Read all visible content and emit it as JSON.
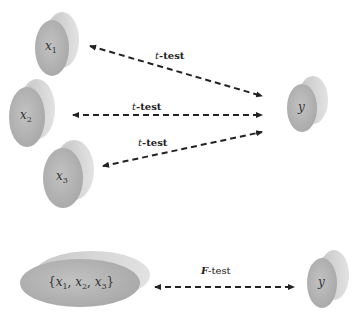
{
  "diagram": {
    "top_section": {
      "predictors": [
        {
          "id": "x1",
          "label": "x",
          "subscript": "1"
        },
        {
          "id": "x2",
          "label": "x",
          "subscript": "2"
        },
        {
          "id": "x3",
          "label": "x",
          "subscript": "3"
        }
      ],
      "response": {
        "id": "y",
        "label": "y"
      },
      "tests": [
        {
          "from": "x1",
          "to": "y",
          "label_italic": "t",
          "label_rest": "-test"
        },
        {
          "from": "x2",
          "to": "y",
          "label_italic": "t",
          "label_rest": "-test"
        },
        {
          "from": "x3",
          "to": "y",
          "label_italic": "t",
          "label_rest": "-test"
        }
      ]
    },
    "bottom_section": {
      "predictor_set": {
        "open": "{",
        "items": [
          {
            "label": "x",
            "subscript": "1"
          },
          {
            "label": "x",
            "subscript": "2"
          },
          {
            "label": "x",
            "subscript": "3"
          }
        ],
        "close": "}"
      },
      "response": {
        "label": "y"
      },
      "test": {
        "label_italic": "F",
        "label_rest": "-test"
      }
    },
    "colors": {
      "cylinder_face": "#b4b4b4",
      "cylinder_side": "#d2d2d2",
      "arrow": "#222222"
    }
  }
}
